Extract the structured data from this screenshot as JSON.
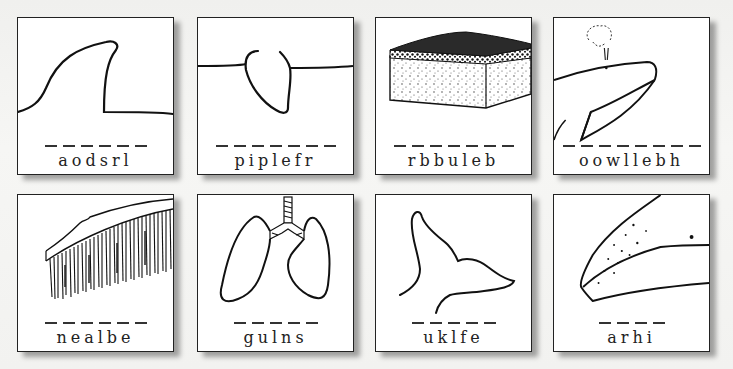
{
  "worksheet": {
    "cards": [
      {
        "id": "fin",
        "scrambled": "aodsrl",
        "letters": 6,
        "picture": "dorsal-fin-illustration"
      },
      {
        "id": "flipper",
        "scrambled": "piplefr",
        "letters": 7,
        "picture": "flipper-illustration"
      },
      {
        "id": "blubber",
        "scrambled": "rbbuleb",
        "letters": 7,
        "picture": "blubber-block-illustration"
      },
      {
        "id": "blowhole",
        "scrambled": "oowllebh",
        "letters": 8,
        "picture": "whale-blowhole-illustration"
      },
      {
        "id": "baleen",
        "scrambled": "nealbe",
        "letters": 6,
        "picture": "baleen-illustration"
      },
      {
        "id": "lungs",
        "scrambled": "gulns",
        "letters": 5,
        "picture": "lungs-illustration"
      },
      {
        "id": "fluke",
        "scrambled": "uklfe",
        "letters": 5,
        "picture": "whale-fluke-illustration"
      },
      {
        "id": "hair",
        "scrambled": "arhi",
        "letters": 4,
        "picture": "whale-head-hair-illustration"
      }
    ]
  },
  "colors": {
    "ink": "#222222",
    "card_bg": "#ffffff",
    "page_bg": "#f4f4f2"
  }
}
